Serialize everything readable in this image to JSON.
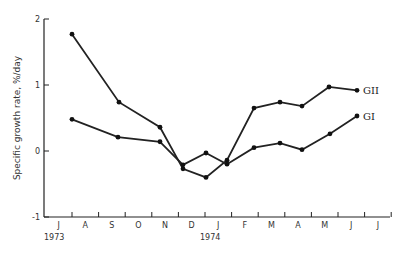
{
  "chart_data": {
    "type": "line",
    "title": "",
    "xlabel": "",
    "ylabel": "Specific growth rate, %/day",
    "ylim": [
      -1,
      2
    ],
    "yticks": [
      "2",
      "1",
      "0",
      "-1"
    ],
    "xtick_labels": [
      "J",
      "A",
      "S",
      "O",
      "N",
      "D",
      "J",
      "F",
      "M",
      "A",
      "M",
      "J",
      "J"
    ],
    "year_labels": [
      {
        "label": "1973",
        "at": "J"
      },
      {
        "label": "1974",
        "at": "J"
      }
    ],
    "grid": false,
    "categories": [
      "Jul-73",
      "Sep-73",
      "Nov-73",
      "Dec-73",
      "Jan-74",
      "Jan-74b",
      "Feb-74",
      "Mar-74",
      "Apr-74",
      "May-74",
      "Jun-74"
    ],
    "series": [
      {
        "name": "GII",
        "x": [
          72,
          119,
          160,
          183,
          206,
          227,
          254,
          280,
          302,
          329,
          357
        ],
        "values": [
          1.77,
          0.74,
          0.36,
          -0.27,
          -0.4,
          -0.14,
          0.65,
          0.74,
          0.68,
          0.97,
          0.92
        ]
      },
      {
        "name": "GI",
        "x": [
          72,
          118,
          160,
          183,
          206,
          227,
          254,
          280,
          302,
          330,
          357
        ],
        "values": [
          0.48,
          0.21,
          0.14,
          -0.21,
          -0.03,
          -0.2,
          0.05,
          0.12,
          0.02,
          0.26,
          0.53
        ]
      }
    ],
    "legend": "inline labels at line ends"
  }
}
